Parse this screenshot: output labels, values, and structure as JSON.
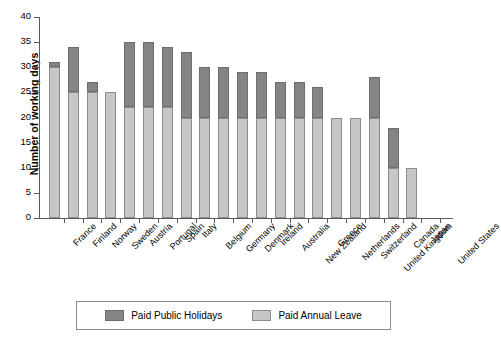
{
  "chart_data": {
    "type": "bar",
    "subtype": "stacked-vertical-bar",
    "title": "",
    "xlabel": "",
    "ylabel": "Number of working days",
    "ylim": [
      0,
      40
    ],
    "ytick_step": 5,
    "yticks": [
      0,
      5,
      10,
      15,
      20,
      25,
      30,
      35,
      40
    ],
    "grid": false,
    "legend_position": "bottom",
    "categories": [
      "France",
      "Finland",
      "Norway",
      "Sweden",
      "Austria",
      "Portugal",
      "Spain",
      "Italy",
      "Belgium",
      "Germany",
      "Denmark",
      "Ireland",
      "Australia",
      "New Zealand",
      "Greece",
      "Netherlands",
      "Switzerland",
      "United Kingdom",
      "Canada",
      "Japan",
      "United States"
    ],
    "series": [
      {
        "name": "Paid Annual Leave",
        "color": "#c6c6c6",
        "values": [
          30,
          25,
          25,
          25,
          22,
          22,
          22,
          20,
          20,
          20,
          20,
          20,
          20,
          20,
          20,
          20,
          20,
          20,
          10,
          10,
          0
        ]
      },
      {
        "name": "Paid Public Holidays",
        "color": "#848484",
        "values": [
          1,
          9,
          2,
          0,
          13,
          13,
          12,
          13,
          10,
          10,
          9,
          9,
          7,
          7,
          6,
          0,
          0,
          8,
          8,
          0,
          0
        ]
      }
    ],
    "totals": [
      31,
      34,
      27,
      25,
      35,
      35,
      34,
      33,
      30,
      30,
      29,
      29,
      27,
      27,
      26,
      20,
      20,
      28,
      18,
      10,
      0
    ]
  },
  "legend": {
    "items": [
      {
        "label": "Paid Public Holidays",
        "color": "#848484",
        "icon": "legend-swatch-icon"
      },
      {
        "label": "Paid Annual Leave",
        "color": "#c6c6c6",
        "icon": "legend-swatch-icon"
      }
    ]
  }
}
